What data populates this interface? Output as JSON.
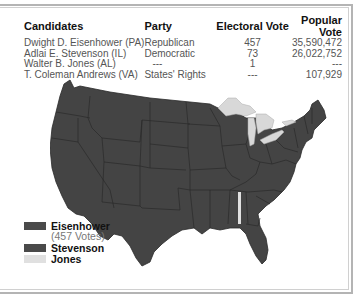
{
  "table": {
    "headers": [
      "Candidates",
      "Party",
      "Electoral Vote",
      "Popular Vote"
    ],
    "rows": [
      {
        "candidate": "Dwight D. Eisenhower (PA)",
        "party": "Republican",
        "electoral": "457",
        "popular": "35,590,472"
      },
      {
        "candidate": "Adlai E. Stevenson (IL)",
        "party": "Democratic",
        "electoral": "73",
        "popular": "26,022,752"
      },
      {
        "candidate": "Walter B. Jones (AL)",
        "party": "---",
        "electoral": "1",
        "popular": "---"
      },
      {
        "candidate": "T. Coleman Andrews (VA)",
        "party": "States' Rights",
        "electoral": "---",
        "popular": "107,929"
      }
    ]
  },
  "legend": {
    "items": [
      {
        "label": "Eisenhower",
        "sub": "(457 Votes)",
        "color": "#4a4a4a"
      },
      {
        "label": "Stevenson",
        "color": "#4a4a4a"
      },
      {
        "label": "Jones",
        "color": "#e0e0e0"
      }
    ]
  },
  "colors": {
    "land": "#444444",
    "borders": "#2a2a2a",
    "lakes": "#d8d8d8",
    "jones": "#e0e0e0"
  }
}
